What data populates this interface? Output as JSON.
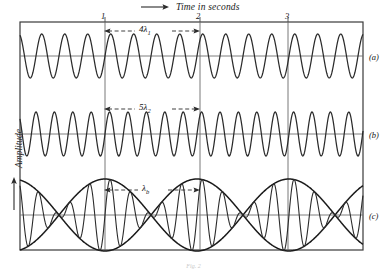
{
  "figure": {
    "header_label": "Time in seconds",
    "y_axis_label": "Amplitude",
    "caption": "Fig. 2",
    "frame": {
      "x": 20,
      "y": 22,
      "width": 343,
      "height": 228,
      "color": "#3a3a3a"
    },
    "axis": {
      "x_min_sec": -0.93,
      "x_max_sec": 2.82,
      "tick_labels": [
        "1",
        "2",
        "3"
      ],
      "tick_seconds": [
        1,
        2,
        3
      ],
      "px_per_second": 92,
      "origin_px": 105
    },
    "panels": [
      {
        "id": "a",
        "letter": "(a)",
        "baseline_y": 56,
        "amplitude_px": 22,
        "cycles_per_second": 4,
        "dimension": {
          "label_html": "4λ",
          "subscript": "1",
          "from_sec": 1,
          "to_sec": 2
        },
        "description": "Uniform sine wave, four wavelengths per second"
      },
      {
        "id": "b",
        "letter": "(b)",
        "baseline_y": 134,
        "amplitude_px": 22,
        "cycles_per_second": 5,
        "dimension": {
          "label_html": "5λ",
          "subscript": "2",
          "from_sec": 1,
          "to_sec": 2
        },
        "description": "Uniform sine wave, five wavelengths per second"
      },
      {
        "id": "c",
        "letter": "(c)",
        "baseline_y": 215,
        "amplitude_px": 36,
        "cycles_per_second": 4.5,
        "beats_per_second": 1,
        "dimension": {
          "label_html": "λ",
          "subscript": "b",
          "from_sec": 1,
          "to_sec": 2
        },
        "description": "Superposition of (a) and (b) producing beats with envelope"
      }
    ],
    "colors": {
      "ink": "#2b2b2b",
      "frame": "#3a3a3a",
      "wave": "#2b2b2b",
      "envelope": "#1a1a1a",
      "baseline": "#707070",
      "gridline": "#6a6a6a"
    }
  },
  "chart_data": {
    "type": "line",
    "title": "Time in seconds",
    "xlabel": "Time in seconds",
    "ylabel": "Amplitude",
    "xlim": [
      -0.93,
      2.82
    ],
    "grid": false,
    "legend": "right",
    "x_ticks": [
      1,
      2,
      3
    ],
    "x_tick_labels": [
      "1",
      "2",
      "3"
    ],
    "series": [
      {
        "name": "(a)",
        "panel": "a",
        "frequency_hz": 4,
        "amplitude": 1,
        "annotation": "4λ₁",
        "annotation_span_sec": [
          1,
          2
        ]
      },
      {
        "name": "(b)",
        "panel": "b",
        "frequency_hz": 5,
        "amplitude": 1,
        "annotation": "5λ₂",
        "annotation_span_sec": [
          1,
          2
        ]
      },
      {
        "name": "(c)",
        "panel": "c",
        "frequency_hz": 4.5,
        "beat_frequency_hz": 1,
        "amplitude": 2,
        "annotation": "λ_b",
        "annotation_span_sec": [
          1,
          2
        ],
        "note": "sum of series (a) and (b); envelope period = 1 second"
      }
    ]
  }
}
